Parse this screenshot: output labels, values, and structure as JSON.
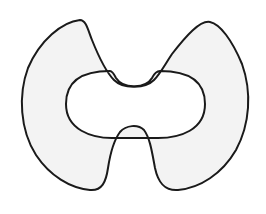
{
  "figure": {
    "colors": {
      "background": "#ffffff",
      "stroke": "#1a1a1a",
      "fill": "#f3f3f3"
    }
  }
}
